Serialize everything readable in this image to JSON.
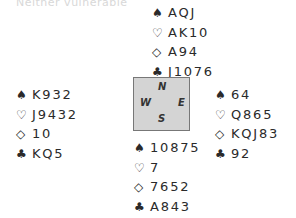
{
  "header": {
    "vulnerability": "Neither vulnerable"
  },
  "compass": {
    "n": "N",
    "s": "S",
    "e": "E",
    "w": "W"
  },
  "suits": {
    "spades": "♠",
    "hearts": "♡",
    "diamonds": "◇",
    "clubs": "♣"
  },
  "hands": {
    "north": {
      "spades": "AQJ",
      "hearts": "AK10",
      "diamonds": "A94",
      "clubs": "J1076"
    },
    "west": {
      "spades": "K932",
      "hearts": "J9432",
      "diamonds": "10",
      "clubs": "KQ5"
    },
    "east": {
      "spades": "64",
      "hearts": "Q865",
      "diamonds": "KQJ83",
      "clubs": "92"
    },
    "south": {
      "spades": "10875",
      "hearts": "7",
      "diamonds": "7652",
      "clubs": "A843"
    }
  }
}
